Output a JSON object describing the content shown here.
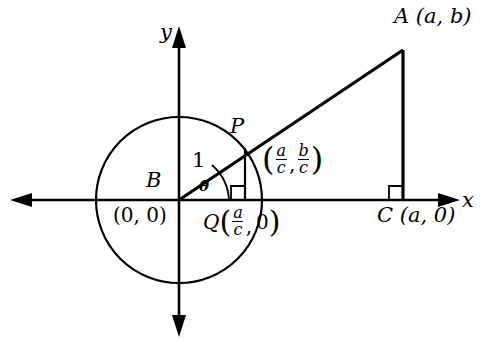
{
  "figure": {
    "background_color": "#ffffff",
    "stroke_color": "#000000",
    "axes": {
      "x_label": "x",
      "y_label": "y",
      "origin_px": [
        179,
        200
      ]
    },
    "circle": {
      "center_px": [
        179,
        200
      ],
      "radius_px": 83,
      "radius_value": "1"
    },
    "labels": {
      "point_a": "A (a, b)",
      "point_b": "B",
      "point_b_coords": "(0, 0)",
      "point_p": "P",
      "point_q_prefix": "Q",
      "point_c": "C (a, 0)",
      "radius_one": "1",
      "angle": "θ",
      "x_axis": "x",
      "y_axis": "y"
    },
    "fractions": {
      "a_over_c_num": "a",
      "a_over_c_den": "c",
      "b_over_c_num": "b",
      "b_over_c_den": "c",
      "zero": "0",
      "comma": ",",
      "paren_open": "(",
      "paren_close": ")"
    },
    "points": {
      "A": [
        403,
        50
      ],
      "B": [
        179,
        200
      ],
      "C": [
        403,
        200
      ],
      "P": [
        245,
        148
      ],
      "Q": [
        245,
        200
      ]
    },
    "right_angle_markers": [
      {
        "name": "right-angle-at-q",
        "x": 232,
        "y": 187
      },
      {
        "name": "right-angle-at-c",
        "x": 390,
        "y": 187
      }
    ]
  }
}
